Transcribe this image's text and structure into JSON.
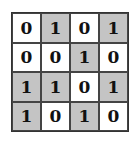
{
  "grid": {
    "rows": 4,
    "cols": 4,
    "shade_color": "#c4c4c4",
    "cells": [
      [
        "0",
        "1",
        "0",
        "1"
      ],
      [
        "0",
        "0",
        "1",
        "0"
      ],
      [
        "1",
        "1",
        "0",
        "1"
      ],
      [
        "1",
        "0",
        "1",
        "0"
      ]
    ]
  }
}
